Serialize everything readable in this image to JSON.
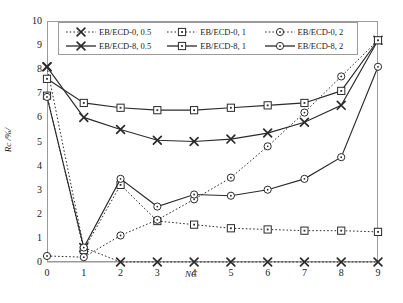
{
  "chart_data": {
    "type": "line",
    "title": "",
    "xlabel": "NC",
    "ylabel": "Rc /%/",
    "xlim": [
      0,
      9
    ],
    "ylim": [
      0,
      10
    ],
    "xticks": [
      "0",
      "1",
      "2",
      "3",
      "4",
      "5",
      "6",
      "7",
      "8",
      "9"
    ],
    "yticks": [
      "0",
      "1",
      "2",
      "3",
      "4",
      "5",
      "6",
      "7",
      "8",
      "9",
      "10"
    ],
    "grid": false,
    "legend_position": "top-inside",
    "x": [
      0,
      1,
      2,
      3,
      4,
      5,
      6,
      7,
      8,
      9
    ],
    "series": [
      {
        "name": "EB/ECD-0, 0.5",
        "marker": "x",
        "linestyle": "dotted",
        "color": "#2b2b2b",
        "values": [
          8.1,
          0.6,
          0.0,
          0.0,
          0.0,
          0.0,
          0.0,
          0.0,
          0.0,
          0.0
        ]
      },
      {
        "name": "EB/ECD-0, 1",
        "marker": "square",
        "linestyle": "dotted",
        "color": "#2b2b2b",
        "values": [
          6.9,
          0.5,
          3.2,
          1.7,
          1.55,
          1.4,
          1.35,
          1.3,
          1.3,
          1.25
        ]
      },
      {
        "name": "EB/ECD-0, 2",
        "marker": "circle",
        "linestyle": "dotted",
        "color": "#2b2b2b",
        "values": [
          0.25,
          0.2,
          1.1,
          1.75,
          2.6,
          3.5,
          4.8,
          6.2,
          7.7,
          9.2
        ]
      },
      {
        "name": "EB/ECD-8, 0.5",
        "marker": "x",
        "linestyle": "solid",
        "color": "#2b2b2b",
        "values": [
          8.1,
          6.0,
          5.5,
          5.05,
          5.0,
          5.1,
          5.35,
          5.8,
          6.5,
          9.2
        ]
      },
      {
        "name": "EB/ECD-8, 1",
        "marker": "square",
        "linestyle": "solid",
        "color": "#2b2b2b",
        "values": [
          7.6,
          6.6,
          6.4,
          6.3,
          6.3,
          6.4,
          6.5,
          6.6,
          7.1,
          9.2
        ]
      },
      {
        "name": "EB/ECD-8, 2",
        "marker": "circle",
        "linestyle": "solid",
        "color": "#2b2b2b",
        "values": [
          6.85,
          0.6,
          3.45,
          2.3,
          2.8,
          2.75,
          3.0,
          3.45,
          4.35,
          8.1
        ]
      }
    ]
  },
  "legend": {
    "rows": [
      [
        {
          "label": "EB/ECD-0, 0.5",
          "marker": "x",
          "linestyle": "dotted"
        },
        {
          "label": "EB/ECD-0, 1",
          "marker": "square",
          "linestyle": "dotted"
        },
        {
          "label": "EB/ECD-0, 2",
          "marker": "circle",
          "linestyle": "dotted"
        }
      ],
      [
        {
          "label": "EB/ECD-8, 0.5",
          "marker": "x",
          "linestyle": "solid"
        },
        {
          "label": "EB/ECD-8, 1",
          "marker": "square",
          "linestyle": "solid"
        },
        {
          "label": "EB/ECD-8, 2",
          "marker": "circle",
          "linestyle": "solid"
        }
      ]
    ]
  }
}
